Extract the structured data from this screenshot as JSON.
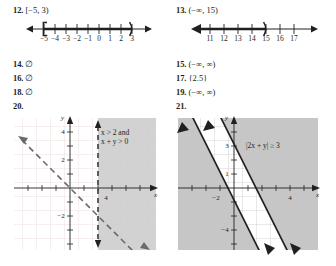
{
  "page": {
    "background": "#ffffff",
    "ink": "#231f20"
  },
  "answers": [
    {
      "number": "12.",
      "text": "[−5, 3)"
    },
    {
      "number": "13.",
      "text": "(−∞, 15)"
    },
    {
      "number": "14.",
      "text": "∅"
    },
    {
      "number": "15.",
      "text": "(−∞, ∞)"
    },
    {
      "number": "16.",
      "text": "∅"
    },
    {
      "number": "17.",
      "text": "{2.5}"
    },
    {
      "number": "18.",
      "text": "∅"
    },
    {
      "number": "19.",
      "text": "(−∞, ∞)"
    },
    {
      "number": "20.",
      "text": ""
    },
    {
      "number": "21.",
      "text": ""
    }
  ],
  "numberlines": [
    {
      "id": "numberline-12",
      "interval": "[−5, 3)",
      "left_endpoint": "−5",
      "left_endpoint_type": "bracket",
      "right_endpoint": "3",
      "right_endpoint_type": "parenthesis",
      "ticks": [
        "−5",
        "−4",
        "−3",
        "−2",
        "−1",
        "0",
        "1",
        "2",
        "3"
      ],
      "left_arrow": true,
      "right_arrow": true,
      "shaded_from": "−5",
      "shaded_to": "3"
    },
    {
      "id": "numberline-13",
      "interval": "(−∞, 15)",
      "left_endpoint": "−∞",
      "left_endpoint_type": "arrow",
      "right_endpoint": "15",
      "right_endpoint_type": "parenthesis",
      "ticks": [
        "11",
        "12",
        "13",
        "14",
        "15",
        "16",
        "17"
      ],
      "left_arrow": true,
      "right_arrow": true,
      "shaded_from": "−∞",
      "shaded_to": "15"
    }
  ],
  "graphs": [
    {
      "id": "graph-20",
      "number": "20.",
      "annotation_line1": "x > 2 and",
      "annotation_line2": "x + y > 0",
      "x_axis_label": "x",
      "y_axis_label": "y",
      "x_tick_labels": [
        "4"
      ],
      "y_tick_labels": [
        "4",
        "2",
        "−2"
      ],
      "line_style": "dashed",
      "shading_color": "#cfcfcf",
      "grid_color": "#e8d9da"
    },
    {
      "id": "graph-21",
      "number": "21.",
      "annotation_line1": "|2x + y| ≥ 3",
      "annotation_line2": "",
      "x_axis_label": "x",
      "y_axis_label": "y",
      "x_tick_labels": [
        "−2",
        "4"
      ],
      "y_tick_labels": [
        "3",
        "1",
        "−4"
      ],
      "line_style": "solid",
      "shading_color": "#c8c8c8",
      "grid_color": "#d9d9d9"
    }
  ]
}
